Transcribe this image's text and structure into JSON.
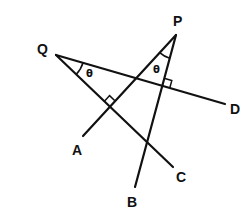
{
  "diagram": {
    "type": "geometry",
    "points": {
      "P": {
        "label": "P",
        "x": 176,
        "y": 35
      },
      "Q": {
        "label": "Q",
        "x": 56,
        "y": 55
      },
      "A": {
        "label": "A",
        "x": 83,
        "y": 136
      },
      "B": {
        "label": "B",
        "x": 135,
        "y": 187
      },
      "C": {
        "label": "C",
        "x": 173,
        "y": 167
      },
      "D": {
        "label": "D",
        "x": 225,
        "y": 104
      }
    },
    "lines": [
      {
        "name": "QD",
        "from": "Q",
        "to": "D"
      },
      {
        "name": "QC",
        "from": "Q",
        "to": "C"
      },
      {
        "name": "PA",
        "from": "P",
        "to": "A"
      },
      {
        "name": "PB",
        "from": "P",
        "to": "B"
      }
    ],
    "angles": [
      {
        "vertex": "Q",
        "between": [
          "QD",
          "QC"
        ],
        "label": "θ"
      },
      {
        "vertex": "P",
        "between": [
          "PA",
          "PB"
        ],
        "label": "θ"
      }
    ],
    "right_angles": [
      {
        "at": "PA ∩ QC",
        "x": 110,
        "y": 107
      },
      {
        "at": "PB ∩ QD",
        "x": 162,
        "y": 86
      }
    ],
    "labels": {
      "P": "P",
      "Q": "Q",
      "A": "A",
      "B": "B",
      "C": "C",
      "D": "D",
      "theta_q": "θ",
      "theta_p": "θ"
    },
    "colors": {
      "line": "#111111",
      "background": "#ffffff"
    }
  }
}
